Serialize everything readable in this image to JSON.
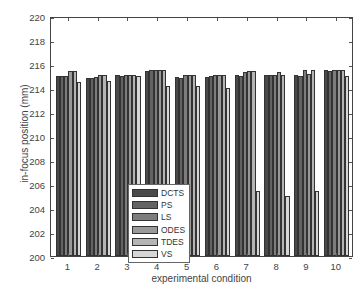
{
  "chart_data": {
    "type": "bar",
    "title": "",
    "xlabel": "experimental condition",
    "ylabel": "in-focus position (mm)",
    "ylim": [
      200,
      220
    ],
    "yticks": [
      200,
      202,
      204,
      206,
      208,
      210,
      212,
      214,
      216,
      218,
      220
    ],
    "categories": [
      "1",
      "2",
      "3",
      "4",
      "5",
      "6",
      "7",
      "8",
      "9",
      "10"
    ],
    "grid": false,
    "legend_position": "inside lower-left-center",
    "series": [
      {
        "name": "DCTS",
        "color": "#4a4a4a",
        "values": [
          215.0,
          214.8,
          215.1,
          215.4,
          214.9,
          214.9,
          215.1,
          215.1,
          215.1,
          215.5
        ]
      },
      {
        "name": "PS",
        "color": "#636363",
        "values": [
          215.0,
          214.8,
          215.0,
          215.5,
          214.8,
          215.0,
          215.0,
          215.1,
          215.0,
          215.4
        ]
      },
      {
        "name": "LS",
        "color": "#7d7d7d",
        "values": [
          215.0,
          214.9,
          215.1,
          215.5,
          215.1,
          215.1,
          215.3,
          215.1,
          215.5,
          215.5
        ]
      },
      {
        "name": "ODES",
        "color": "#999999",
        "values": [
          215.4,
          215.1,
          215.1,
          215.5,
          215.1,
          215.1,
          215.4,
          215.3,
          215.2,
          215.5
        ]
      },
      {
        "name": "TDES",
        "color": "#b4b4b4",
        "values": [
          215.4,
          215.1,
          215.1,
          215.5,
          215.1,
          215.1,
          215.4,
          215.1,
          215.5,
          215.5
        ]
      },
      {
        "name": "VS",
        "color": "#d6d6d6",
        "values": [
          214.5,
          214.6,
          215.0,
          214.2,
          214.2,
          214.0,
          205.4,
          205.0,
          205.4,
          215.0
        ]
      }
    ]
  }
}
